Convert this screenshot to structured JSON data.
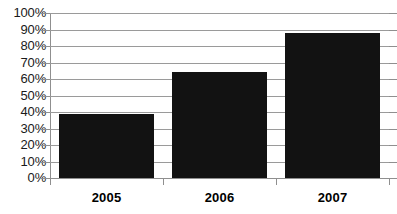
{
  "chart_data": {
    "type": "bar",
    "title": "",
    "subtitle": "",
    "xlabel": "",
    "ylabel": "",
    "categories": [
      "2005",
      "2006",
      "2007"
    ],
    "values": [
      39,
      64,
      88
    ],
    "value_labels": [
      "39%",
      "64%",
      "88%"
    ],
    "ylim": [
      0,
      100
    ],
    "y_ticks": [
      0,
      10,
      20,
      30,
      40,
      50,
      60,
      70,
      80,
      90,
      100
    ],
    "y_tick_labels": [
      "0%",
      "10%",
      "20%",
      "30%",
      "40%",
      "50%",
      "60%",
      "70%",
      "80%",
      "90%",
      "100%"
    ],
    "grid": true,
    "legend": false,
    "legend_position": "none",
    "series": [
      {
        "name": "",
        "values": [
          39,
          64,
          88
        ]
      }
    ],
    "colors": {
      "bar": "#121212",
      "gridline": "#9a9a9a",
      "axis": "#8f8f8f",
      "background": "#ffffff",
      "tick_label": "#1a1a1a",
      "category_label": "#000000"
    }
  }
}
